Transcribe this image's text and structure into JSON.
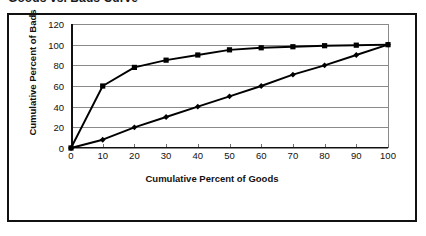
{
  "chart_title": "Goods vs. Bads Curve",
  "chart_data": {
    "type": "line",
    "title": "Goods vs. Bads Curve",
    "xlabel": "Cumulative Percent of Goods",
    "ylabel": "Cumulative Percent of Bads",
    "xlim": [
      0,
      100
    ],
    "ylim": [
      0,
      120
    ],
    "xticks": [
      0,
      10,
      20,
      30,
      40,
      50,
      60,
      70,
      80,
      90,
      100
    ],
    "yticks": [
      0,
      20,
      40,
      60,
      80,
      100,
      120
    ],
    "grid": true,
    "legend_position": "none",
    "x": [
      0,
      10,
      20,
      30,
      40,
      50,
      60,
      70,
      80,
      90,
      100
    ],
    "series": [
      {
        "name": "Model Curve",
        "marker": "square",
        "color": "#000000",
        "values": [
          0,
          60,
          78,
          85,
          90,
          95,
          97,
          98,
          99,
          99.5,
          100
        ]
      },
      {
        "name": "Random Diagonal",
        "marker": "diamond",
        "color": "#000000",
        "values": [
          0,
          8,
          20,
          30,
          40,
          50,
          60,
          71,
          80,
          90,
          100
        ]
      }
    ]
  },
  "colors": {
    "frame": "#111111",
    "gridline": "#8a8a8a",
    "axis": "#111111",
    "series": "#000000",
    "background": "#ffffff"
  }
}
